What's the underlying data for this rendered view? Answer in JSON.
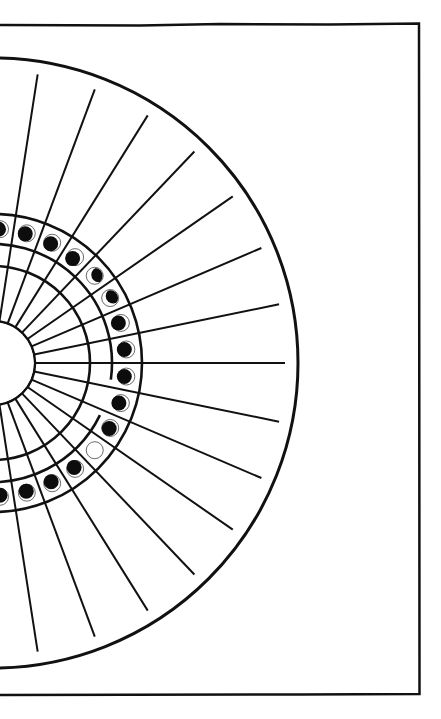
{
  "diagram": {
    "title": "",
    "colors": {
      "line": "#111111",
      "background": "#ffffff",
      "moon_dark": "#0d0d0d"
    },
    "frame": {
      "x": 0,
      "y": 24,
      "right": 419,
      "bottom": 694
    },
    "center": {
      "x": -7,
      "y": 363
    },
    "radii": {
      "hub": 42,
      "ring1": 97,
      "ring2": 119,
      "ring3": 149,
      "outer": 305,
      "spoke_end": 292,
      "moon_ring": 134,
      "moon": 8.5
    },
    "spoke_angle_step_deg": 11.6,
    "spokes_deg": [
      -81.2,
      -69.6,
      -58,
      -46.4,
      -34.8,
      -23.2,
      -11.6,
      0,
      11.6,
      23.2,
      34.8,
      46.4,
      58,
      69.6,
      81.2
    ],
    "moons": [
      {
        "angle": -87.0,
        "phase": "waxing-crescent-thin",
        "dark_dx": -1.5,
        "dark_dy": 0
      },
      {
        "angle": -75.4,
        "phase": "waxing-crescent-thin",
        "dark_dx": -1.5,
        "dark_dy": 0.5
      },
      {
        "angle": -63.8,
        "phase": "waxing-crescent-thin",
        "dark_dx": -1.5,
        "dark_dy": 1
      },
      {
        "angle": -52.2,
        "phase": "waxing-crescent",
        "dark_dx": -2.5,
        "dark_dy": 1.5
      },
      {
        "angle": -40.6,
        "phase": "first-quarter",
        "dark_dx": 4,
        "dark_dy": -1,
        "half": true
      },
      {
        "angle": -29.0,
        "phase": "first-quarter",
        "dark_dx": 3,
        "dark_dy": -2,
        "half": true
      },
      {
        "angle": -17.4,
        "phase": "waning-crescent",
        "dark_dx": -2.5,
        "dark_dy": 0
      },
      {
        "angle": -5.8,
        "phase": "waning-crescent",
        "dark_dx": -2,
        "dark_dy": 0
      },
      {
        "angle": 5.8,
        "phase": "waning-crescent",
        "dark_dx": -2,
        "dark_dy": 0
      },
      {
        "angle": 17.4,
        "phase": "waning-crescent",
        "dark_dx": -2,
        "dark_dy": 0
      },
      {
        "angle": 29.0,
        "phase": "new-moon-dark",
        "dark_dx": -1,
        "dark_dy": 0.5
      },
      {
        "angle": 40.6,
        "phase": "full-moon-empty",
        "empty": true
      },
      {
        "angle": 52.2,
        "phase": "waning-crescent-thin",
        "dark_dx": -1,
        "dark_dy": -1.5
      },
      {
        "angle": 63.8,
        "phase": "waning-crescent-thin",
        "dark_dx": -1,
        "dark_dy": -1.5
      },
      {
        "angle": 75.4,
        "phase": "waning-crescent-thin",
        "dark_dx": -0.5,
        "dark_dy": -1.5
      },
      {
        "angle": 87.0,
        "phase": "waning-crescent-thin",
        "dark_dx": 0,
        "dark_dy": -1.5
      }
    ],
    "ring2_gap_deg": [
      8,
      26
    ]
  }
}
